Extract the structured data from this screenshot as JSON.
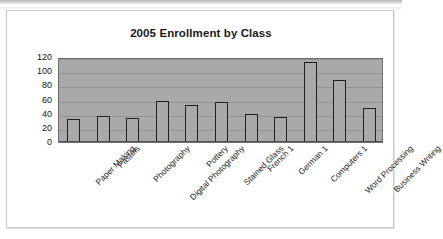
{
  "chart_data": {
    "type": "bar",
    "title": "2005 Enrollment by Class",
    "xlabel": "",
    "ylabel": "",
    "ylim": [
      0,
      120
    ],
    "yticks": [
      0,
      20,
      40,
      60,
      80,
      100,
      120
    ],
    "grid": true,
    "legend": "none",
    "plot_background": "#a9a9a9",
    "bar_fill": "#a9a9a9",
    "bar_border": "#1f1f1f",
    "categories": [
      "Paper Making",
      "Pastels",
      "Photography",
      "Digital Photography",
      "Pottery",
      "Stained Glass",
      "French 1",
      "German 1",
      "Computers 1",
      "Word Processing",
      "Business Writing"
    ],
    "values": [
      32,
      37,
      34,
      58,
      52,
      56,
      40,
      35,
      113,
      88,
      48
    ]
  }
}
